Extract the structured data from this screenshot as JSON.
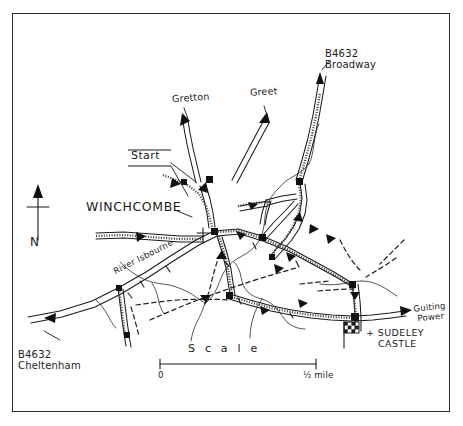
{
  "map": {
    "title": "Winchcombe walking route sketch map",
    "frame": {
      "border_color": "#2b2b2b"
    },
    "labels": {
      "gretton": "Gretton",
      "greet": "Greet",
      "broadway_road": "B4632",
      "broadway_place": "Broadway",
      "cheltenham_road": "B4632",
      "cheltenham_place": "Cheltenham",
      "winchcombe": "WINCHCOMBE",
      "start": "Start",
      "river": "River Isbourne",
      "guiting_line1": "Guiting",
      "guiting_line2": "Power",
      "sudeley_line1": "SUDELEY",
      "sudeley_line2": "CASTLE",
      "sudeley_marker": "+",
      "north": "N"
    },
    "scale": {
      "caption": "S c a l e",
      "min_label": "0",
      "max_label": "½ mile"
    },
    "icons": {
      "north_arrow": "north-arrow-icon",
      "castle_flag": "castle-flag-icon",
      "church_cross": "church-cross-icon"
    },
    "colors": {
      "ink": "#1a1a1a",
      "paper": "#ffffff",
      "route": "#3b3b3b"
    }
  }
}
